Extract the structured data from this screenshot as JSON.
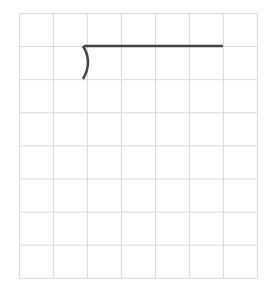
{
  "grid": {
    "x0": 19,
    "y0": 13,
    "cols": 7,
    "rows": 8,
    "cell_w": 34,
    "cell_h": 33.1,
    "line_color": "#d9d9d9",
    "line_width": 1
  },
  "strokes": [
    {
      "kind": "line",
      "x1": 84,
      "y1": 46,
      "x2": 223,
      "y2": 46,
      "color": "#444444",
      "width": 2.5
    },
    {
      "kind": "arc-path",
      "d": "M 83 46 Q 93 62 83 79",
      "color": "#444444",
      "width": 2.5
    }
  ]
}
